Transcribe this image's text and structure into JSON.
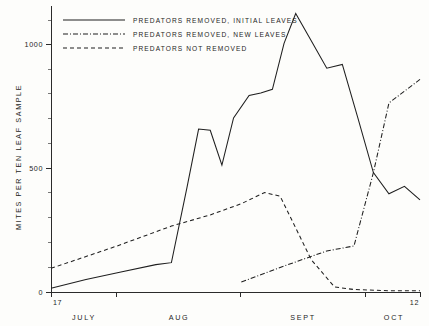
{
  "chart_data": {
    "type": "line",
    "title": "",
    "xlabel": "",
    "ylabel": "MITES PER TEN LEAF SAMPLE",
    "ylim": [
      0,
      1150
    ],
    "yticks": [
      0,
      500,
      1000
    ],
    "ytick_labels": [
      "0",
      "500",
      "1000"
    ],
    "xlim_labels": {
      "left": "17",
      "right": "12"
    },
    "x_month_labels": [
      "JULY",
      "AUG",
      "SEPT",
      "OCT"
    ],
    "grid": false,
    "legend_position": "top-left",
    "series": [
      {
        "name": "PREDATORS  REMOVED,  INITIAL  LEAVES",
        "style": "solid",
        "x": [
          17,
          26,
          35,
          44,
          48,
          52,
          55,
          58,
          61,
          64,
          68,
          71,
          74,
          77,
          80,
          84,
          88,
          92,
          96,
          100,
          104,
          108,
          112
        ],
        "values": [
          15,
          50,
          80,
          110,
          118,
          420,
          655,
          650,
          510,
          700,
          790,
          800,
          815,
          1000,
          1120,
          1010,
          900,
          915,
          700,
          480,
          395,
          425,
          370
        ]
      },
      {
        "name": "PREDATORS  REMOVED,  NEW  LEAVES",
        "style": "dash-dot",
        "x": [
          66,
          78,
          88,
          95,
          100,
          104,
          112
        ],
        "values": [
          40,
          110,
          165,
          185,
          480,
          760,
          855
        ]
      },
      {
        "name": "PREDATORS  NOT  REMOVED",
        "style": "dashed",
        "x": [
          17,
          34,
          48,
          58,
          66,
          72,
          76,
          84,
          90,
          95,
          104,
          112
        ],
        "values": [
          95,
          185,
          265,
          310,
          355,
          400,
          385,
          130,
          20,
          10,
          5,
          5
        ]
      }
    ],
    "legend_entries": [
      {
        "label": "PREDATORS  REMOVED,  INITIAL  LEAVES",
        "style": "solid"
      },
      {
        "label": "PREDATORS  REMOVED,  NEW  LEAVES",
        "style": "dash-dot"
      },
      {
        "label": "PREDATORS  NOT  REMOVED",
        "style": "dashed"
      }
    ]
  }
}
